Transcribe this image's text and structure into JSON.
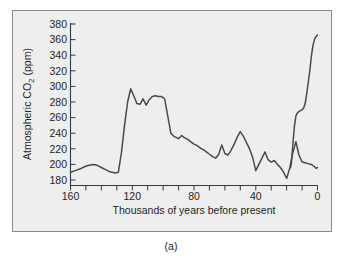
{
  "figure": {
    "caption": "(a)",
    "background_color": "#eeeeee",
    "border_color": "#8a8a8a",
    "line_color": "#4a4a4a"
  },
  "chart_data": {
    "type": "line",
    "title": "",
    "xlabel": "Thousands of years before present",
    "ylabel_prefix": "Atmospheric CO",
    "ylabel_sub": "2",
    "ylabel_suffix": " (ppm)",
    "ylabel_full": "Atmospheric CO2 (ppm)",
    "xlim": [
      160,
      0
    ],
    "ylim": [
      180,
      380
    ],
    "x_reversed": true,
    "grid": false,
    "legend": "none",
    "xticks": [
      160,
      150,
      140,
      130,
      120,
      110,
      100,
      90,
      80,
      70,
      60,
      50,
      40,
      30,
      20,
      10,
      0
    ],
    "xtick_labels": [
      "160",
      "",
      "",
      "",
      "120",
      "",
      "",
      "",
      "80",
      "",
      "",
      "",
      "40",
      "",
      "",
      "",
      "0"
    ],
    "yticks": [
      180,
      200,
      220,
      240,
      260,
      280,
      300,
      320,
      340,
      360,
      380
    ],
    "ytick_labels": [
      "180",
      "200",
      "220",
      "240",
      "260",
      "280",
      "300",
      "320",
      "340",
      "360",
      "380"
    ],
    "series": [
      {
        "name": "Vostok ice core atmospheric CO2",
        "x": [
          160,
          157,
          154,
          151,
          148,
          145,
          143,
          140,
          137,
          135,
          133,
          131,
          129,
          127,
          125,
          123,
          121,
          119,
          117,
          115,
          113,
          111,
          109,
          107,
          105,
          103,
          101,
          99,
          97,
          95,
          93,
          90,
          88,
          86,
          84,
          82,
          80,
          78,
          76,
          74,
          72,
          70,
          68,
          66,
          64,
          62,
          60,
          58,
          56,
          54,
          52,
          50,
          48,
          46,
          44,
          42,
          40,
          38,
          36,
          34,
          32,
          30,
          28,
          26,
          24,
          22,
          20,
          18,
          16,
          14,
          12,
          10,
          8,
          6,
          4,
          2,
          1,
          0
        ],
        "y": [
          190,
          192,
          194,
          197,
          199,
          200,
          199,
          196,
          193,
          191,
          190,
          189,
          190,
          215,
          250,
          280,
          297,
          288,
          278,
          277,
          284,
          276,
          283,
          287,
          288,
          287,
          287,
          284,
          262,
          240,
          236,
          233,
          237,
          234,
          232,
          229,
          226,
          224,
          221,
          219,
          216,
          213,
          210,
          208,
          213,
          225,
          214,
          212,
          218,
          226,
          235,
          242,
          236,
          228,
          220,
          209,
          192,
          200,
          208,
          216,
          206,
          203,
          205,
          200,
          196,
          190,
          182,
          195,
          215,
          229,
          212,
          203,
          202,
          201,
          200,
          197,
          195,
          196
        ]
      },
      {
        "name": "Modern industrial rise",
        "x": [
          18,
          17.5,
          17,
          16,
          15,
          14,
          13,
          12,
          11,
          10,
          9,
          8,
          7,
          6,
          5,
          4,
          3,
          2,
          1,
          0.5,
          0
        ],
        "y": [
          195,
          196,
          200,
          225,
          248,
          262,
          266,
          268,
          269,
          270,
          272,
          278,
          290,
          305,
          320,
          338,
          352,
          360,
          364,
          365,
          366
        ]
      }
    ]
  }
}
